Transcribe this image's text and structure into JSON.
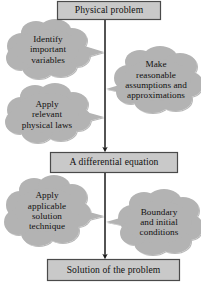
{
  "diagram": {
    "colors": {
      "box_fill": "#c9c9c9",
      "box_border": "#4a4a4a",
      "cloud_fill": "#b3b3b3",
      "arrow": "#1a1a1a",
      "text": "#101010",
      "background": "#ffffff"
    },
    "boxes": [
      {
        "id": "physical-problem",
        "label": "Physical problem",
        "x": 57,
        "y": 1,
        "w": 104,
        "h": 19
      },
      {
        "id": "differential-equation",
        "label": "A differential equation",
        "x": 50,
        "y": 152,
        "w": 128,
        "h": 21
      },
      {
        "id": "solution-of-problem",
        "label": "Solution of the problem",
        "x": 47,
        "y": 259,
        "w": 133,
        "h": 22
      }
    ],
    "clouds": [
      {
        "id": "identify-important-variables",
        "label": "Identify\nimportant\nvariables",
        "cx": 48,
        "cy": 49,
        "rx": 46,
        "ry": 27,
        "tail_to_x": 104,
        "tail_to_y": 52,
        "side": "right"
      },
      {
        "id": "make-reasonable-assumptions",
        "label": "Make\nreasonable\nassumptions and\napproximations",
        "cx": 155,
        "cy": 80,
        "rx": 46,
        "ry": 29,
        "tail_to_x": 106,
        "tail_to_y": 89,
        "side": "left"
      },
      {
        "id": "apply-relevant-physical-laws",
        "label": "Apply\nrelevant\nphysical laws",
        "cx": 48,
        "cy": 113,
        "rx": 46,
        "ry": 26,
        "tail_to_x": 104,
        "tail_to_y": 117,
        "side": "right"
      },
      {
        "id": "apply-applicable-solution-technique",
        "label": "Apply\napplicable\nsolution\ntechnique",
        "cx": 47,
        "cy": 210,
        "rx": 45,
        "ry": 30,
        "tail_to_x": 104,
        "tail_to_y": 216,
        "side": "right"
      },
      {
        "id": "boundary-initial-conditions",
        "label": "Boundary\nand initial\nconditions",
        "cx": 158,
        "cy": 222,
        "rx": 44,
        "ry": 28,
        "tail_to_x": 106,
        "tail_to_y": 222,
        "side": "left"
      }
    ],
    "arrows": [
      {
        "id": "arrow-problem-to-equation",
        "from": "physical-problem",
        "to": "differential-equation",
        "x": 105,
        "y1": 20,
        "y2": 152
      },
      {
        "id": "arrow-equation-to-solution",
        "from": "differential-equation",
        "to": "solution-of-problem",
        "x": 105,
        "y1": 173,
        "y2": 259
      }
    ]
  }
}
